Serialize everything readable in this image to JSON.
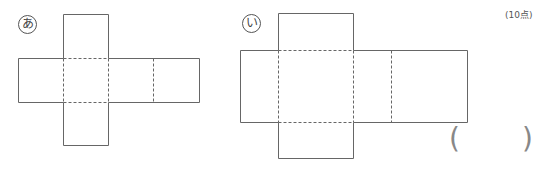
{
  "problem": {
    "points": "(10点)",
    "answer_open": "(",
    "answer_close": ")",
    "answer_value": ""
  },
  "nets": [
    {
      "label": "あ",
      "description": "cube net, 6 squares: cross shape with row of 4 squares and one square above and below the second square"
    },
    {
      "label": "い",
      "description": "rectangular box net: row of 4 faces with one face above and below the second face"
    }
  ],
  "colors": {
    "line": "#666666",
    "paren": "#888888"
  }
}
